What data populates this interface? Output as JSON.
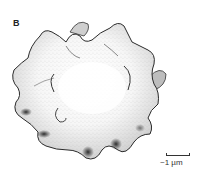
{
  "figure": {
    "panel_label": "B",
    "scale_bar": {
      "label": "~1 µm"
    },
    "colors": {
      "background": "#ffffff",
      "ink": "#2a2a2a",
      "shadow": "#1a1a1a",
      "stipple": "#9a9a9a"
    }
  }
}
